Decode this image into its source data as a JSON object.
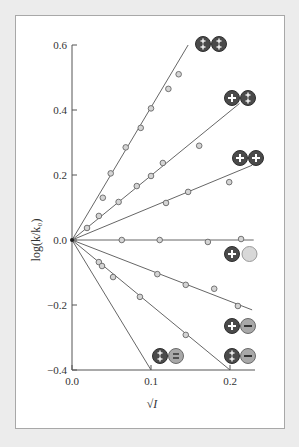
{
  "chart_data": {
    "type": "scatter",
    "title": "",
    "xlabel": "√I",
    "ylabel": "log(k/k₀)",
    "xlim": [
      0.0,
      0.23
    ],
    "ylim": [
      -0.4,
      0.6
    ],
    "x_ticks": [
      "0.0",
      "0.1",
      "0.2"
    ],
    "y_ticks": [
      "0.6",
      "0.4",
      "0.2",
      "0.0",
      "−0.2",
      "−0.4"
    ],
    "grid": false,
    "legend_position": "inline-at-line-ends",
    "series": [
      {
        "name": "2+ / 2+",
        "ion_charges": [
          "2+",
          "2+"
        ],
        "fit_slope": 4.08,
        "line_end": [
          0.147,
          0.6
        ],
        "points": [
          [
            0.039,
            0.13
          ],
          [
            0.049,
            0.205
          ],
          [
            0.068,
            0.285
          ],
          [
            0.087,
            0.345
          ],
          [
            0.1,
            0.405
          ],
          [
            0.122,
            0.465
          ],
          [
            0.135,
            0.51
          ]
        ]
      },
      {
        "name": "1+ / 2+",
        "ion_charges": [
          "1+",
          "2+"
        ],
        "fit_slope": 2.0,
        "line_end": [
          0.212,
          0.42
        ],
        "points": [
          [
            0.019,
            0.037
          ],
          [
            0.034,
            0.074
          ],
          [
            0.059,
            0.117
          ],
          [
            0.082,
            0.166
          ],
          [
            0.1,
            0.197
          ],
          [
            0.115,
            0.237
          ],
          [
            0.161,
            0.29
          ]
        ]
      },
      {
        "name": "1+ / 1+",
        "ion_charges": [
          "1+",
          "1+"
        ],
        "fit_slope": 1.0,
        "line_end": [
          0.228,
          0.23
        ],
        "points": [
          [
            0.119,
            0.114
          ],
          [
            0.147,
            0.148
          ],
          [
            0.199,
            0.178
          ]
        ]
      },
      {
        "name": "1+ / neutral",
        "ion_charges": [
          "1+",
          "0"
        ],
        "fit_slope": 0.0,
        "line_end": [
          0.23,
          0.0
        ],
        "points": [
          [
            0.063,
            0.0
          ],
          [
            0.111,
            0.0
          ],
          [
            0.172,
            -0.006
          ],
          [
            0.214,
            0.003
          ]
        ]
      },
      {
        "name": "1+ / 1−",
        "ion_charges": [
          "1+",
          "1−"
        ],
        "fit_slope": -1.0,
        "line_end": [
          0.228,
          -0.215
        ],
        "points": [
          [
            0.108,
            -0.105
          ],
          [
            0.144,
            -0.138
          ],
          [
            0.18,
            -0.15
          ],
          [
            0.21,
            -0.203
          ]
        ]
      },
      {
        "name": "2+ / 1−",
        "ion_charges": [
          "2+",
          "1−"
        ],
        "fit_slope": -2.0,
        "line_end": [
          0.2,
          -0.4
        ],
        "points": [
          [
            0.034,
            -0.068
          ],
          [
            0.038,
            -0.08
          ],
          [
            0.052,
            -0.114
          ],
          [
            0.086,
            -0.175
          ],
          [
            0.144,
            -0.292
          ]
        ]
      },
      {
        "name": "2+ / 2−",
        "ion_charges": [
          "2+",
          "2−"
        ],
        "fit_slope": -4.0,
        "line_end": [
          0.1,
          -0.4
        ],
        "points": []
      }
    ]
  },
  "colors": {
    "background": "#ececec",
    "panel": "#ffffff",
    "line": "#555555",
    "marker_fill": "#d4d4d4",
    "marker_stroke": "#666666",
    "cation": "#4a4a4a",
    "anion": "#a8a8a8",
    "neutral": "#d8d8d8"
  }
}
